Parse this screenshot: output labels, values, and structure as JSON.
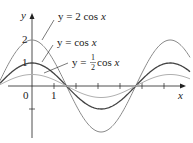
{
  "chart_data": {
    "type": "line",
    "title": "",
    "xlabel": "x",
    "ylabel": "y",
    "xlim": [
      -1.45,
      7.2
    ],
    "ylim": [
      -2.4,
      2.8
    ],
    "grid": false,
    "x_ticks": [
      {
        "value": 0,
        "label": "0"
      },
      {
        "value": 1,
        "label": "1"
      }
    ],
    "y_ticks": [
      {
        "value": 2,
        "label": "2"
      },
      {
        "value": 1,
        "label": "1"
      },
      {
        "value": -1,
        "label": ""
      }
    ],
    "series": [
      {
        "name": "y = 2 cos x",
        "function": "2*cos(x)",
        "amplitude": 2,
        "color": "#8a8a8a"
      },
      {
        "name": "y = cos x",
        "function": "cos(x)",
        "amplitude": 1,
        "color": "#444444"
      },
      {
        "name": "y = 1/2 cos x",
        "function": "0.5*cos(x)",
        "amplitude": 0.5,
        "color": "#b0b0b0"
      }
    ],
    "annotations": [
      {
        "text": "y = 2 cos x",
        "points_to": "series 0 near x≈0.5"
      },
      {
        "text": "y = cos x",
        "points_to": "series 1 near x≈0.5"
      },
      {
        "text": "y = 1/2 cos x",
        "points_to": "series 2 near x≈0.5"
      }
    ]
  },
  "labels": {
    "y_axis": "y",
    "x_axis": "x",
    "tick_0": "0",
    "tick_x1": "1",
    "tick_y1": "1",
    "tick_y2": "2",
    "ann1_prefix": "y = 2 cos ",
    "ann1_var": "x",
    "ann2_prefix": "y = cos ",
    "ann2_var": "x",
    "ann3_prefix": "y = ",
    "ann3_num": "1",
    "ann3_den": "2",
    "ann3_suffix": " cos ",
    "ann3_var": "x"
  }
}
